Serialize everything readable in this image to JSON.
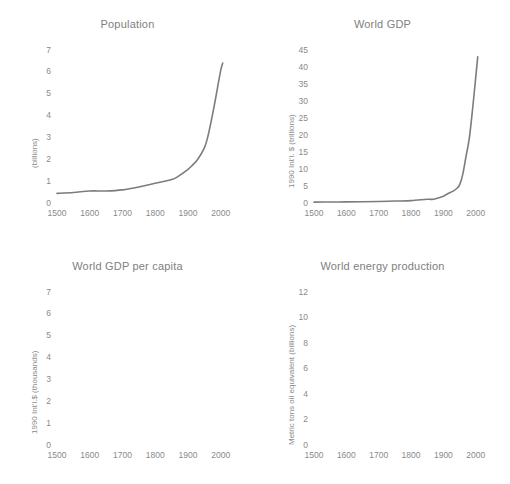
{
  "figure": {
    "panel_count": 4,
    "line_color": "#7c7c7c",
    "dotted_color": "#a8a8a8",
    "text_color": "#8a8a8a"
  },
  "chart_data": [
    {
      "type": "line",
      "title": "Population",
      "xlabel": "",
      "ylabel": "(billions)",
      "xlim": [
        1500,
        2010
      ],
      "ylim": [
        0,
        7
      ],
      "xticks": [
        1500,
        1600,
        1700,
        1800,
        1900,
        2000
      ],
      "yticks": [
        0,
        1,
        2,
        3,
        4,
        5,
        6,
        7
      ],
      "grid": false,
      "legend": "none",
      "x": [
        1500,
        1550,
        1600,
        1650,
        1700,
        1750,
        1800,
        1850,
        1870,
        1900,
        1913,
        1930,
        1950,
        1960,
        1970,
        1980,
        1990,
        2000,
        2006
      ],
      "values": [
        0.44,
        0.48,
        0.55,
        0.55,
        0.6,
        0.73,
        0.9,
        1.07,
        1.22,
        1.54,
        1.72,
        2.0,
        2.52,
        3.0,
        3.68,
        4.43,
        5.26,
        6.07,
        6.4
      ]
    },
    {
      "type": "line",
      "title": "World GDP",
      "xlabel": "",
      "ylabel": "1990 Int'l. $ (trillions)",
      "xlim": [
        1500,
        2010
      ],
      "ylim": [
        0,
        45
      ],
      "xticks": [
        1500,
        1600,
        1700,
        1800,
        1900,
        2000
      ],
      "yticks": [
        0,
        5,
        10,
        15,
        20,
        25,
        30,
        35,
        40,
        45
      ],
      "grid": false,
      "legend": "none",
      "x": [
        1500,
        1550,
        1600,
        1650,
        1700,
        1750,
        1800,
        1850,
        1870,
        1900,
        1913,
        1930,
        1940,
        1950,
        1960,
        1970,
        1980,
        1990,
        2000,
        2006
      ],
      "values": [
        0.25,
        0.29,
        0.33,
        0.37,
        0.43,
        0.57,
        0.69,
        1.1,
        1.1,
        1.97,
        2.73,
        3.5,
        4.2,
        5.34,
        8.5,
        13.8,
        19.0,
        27.5,
        37.0,
        43.0
      ]
    },
    {
      "type": "line",
      "title": "World GDP per capita",
      "xlabel": "",
      "ylabel": "1990 Int'l.$ (thousands)",
      "xlim": [
        1500,
        2010
      ],
      "ylim": [
        0,
        7
      ],
      "xticks": [
        1500,
        1600,
        1700,
        1800,
        1900,
        2000
      ],
      "yticks": [
        0,
        1,
        2,
        3,
        4,
        5,
        6,
        7
      ],
      "grid": false,
      "legend": "none",
      "x": [
        1500,
        1550,
        1600,
        1650,
        1700,
        1750,
        1800,
        1850,
        1870,
        1900,
        1913,
        1930,
        1940,
        1950,
        1960,
        1970,
        1980,
        1990,
        2000,
        2006
      ],
      "values": [
        0.57,
        0.57,
        0.59,
        0.59,
        0.6,
        0.63,
        0.67,
        0.82,
        0.87,
        1.26,
        1.53,
        1.8,
        2.0,
        2.11,
        2.77,
        3.73,
        4.52,
        5.15,
        6.04,
        6.6
      ]
    },
    {
      "type": "line",
      "title": "World energy production",
      "xlabel": "",
      "ylabel": "Metric tons oil equivalent (billions)",
      "xlim": [
        1500,
        2010
      ],
      "ylim": [
        0,
        12
      ],
      "xticks": [
        1500,
        1600,
        1700,
        1800,
        1900,
        2000
      ],
      "yticks": [
        0,
        2,
        4,
        6,
        8,
        10,
        12
      ],
      "grid": false,
      "legend": "none",
      "series": [
        {
          "name": "estimated-early-energy",
          "style": "dotted",
          "x": [
            1550,
            1600,
            1650,
            1700,
            1750,
            1800,
            1850,
            1870,
            1900
          ],
          "values": [
            0.1,
            0.11,
            0.12,
            0.13,
            0.15,
            0.17,
            0.2,
            0.24,
            0.35
          ]
        },
        {
          "name": "recorded-energy-production",
          "style": "solid",
          "x": [
            1900,
            1910,
            1920,
            1930,
            1940,
            1950,
            1960,
            1970,
            1975,
            1980,
            1985,
            1990,
            1995,
            2000,
            2005,
            2008
          ],
          "values": [
            0.35,
            0.52,
            0.65,
            0.78,
            0.95,
            1.6,
            2.7,
            4.6,
            5.7,
            6.6,
            6.9,
            8.0,
            8.5,
            9.1,
            10.0,
            10.3
          ]
        }
      ]
    }
  ]
}
